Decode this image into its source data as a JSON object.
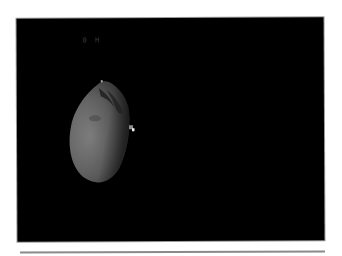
{
  "image": {
    "description": "Dark astronomical frame showing an illuminated irregular moon/asteroid limb with a small bright companion object",
    "overlay_label": "0 H",
    "colors": {
      "background": "#000000",
      "body_lit": "#7a7a7a",
      "body_shadow": "#2a2a2a",
      "companion": "#e0e0e0",
      "page": "#ffffff",
      "rule": "#8a8a8a"
    }
  }
}
